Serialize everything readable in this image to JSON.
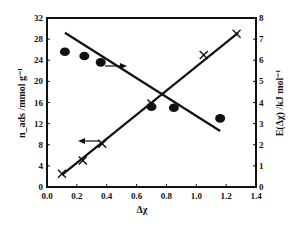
{
  "chart_data": {
    "type": "scatter",
    "title": "",
    "xlabel": "Δχ",
    "ylabel_left": "n_ads /mmol g⁻¹",
    "ylabel_right": "E(Δχ) /kJ mol⁻¹",
    "xlim": [
      0.0,
      1.4
    ],
    "ylim_left": [
      0,
      32
    ],
    "ylim_right": [
      0,
      8
    ],
    "x_ticks": [
      "0.0",
      "0.2",
      "0.4",
      "0.6",
      "0.8",
      "1.0",
      "1.2",
      "1.4"
    ],
    "y_ticks_left": [
      "0",
      "4",
      "8",
      "12",
      "16",
      "20",
      "24",
      "28",
      "32"
    ],
    "y_ticks_right": [
      "0",
      "1",
      "2",
      "3",
      "4",
      "5",
      "6",
      "7",
      "8"
    ],
    "grid": false,
    "legend": "none (arrows indicate axis for each series)",
    "series": [
      {
        "name": "n_ads",
        "axis": "left",
        "marker": "cross",
        "arrow": "left",
        "x": [
          0.1,
          0.24,
          0.37,
          0.7,
          1.05,
          1.27
        ],
        "values": [
          2.5,
          5.0,
          8.2,
          15.8,
          25.0,
          29.0
        ],
        "fit_line": {
          "x": [
            0.1,
            1.28
          ],
          "y": [
            2.3,
            29.2
          ]
        }
      },
      {
        "name": "E(Δχ)",
        "axis": "right",
        "marker": "filled-circle",
        "arrow": "right",
        "x": [
          0.12,
          0.25,
          0.36,
          0.7,
          0.85,
          1.16
        ],
        "values": [
          6.4,
          6.2,
          5.9,
          3.8,
          3.75,
          3.25
        ],
        "fit_line": {
          "x": [
            0.12,
            1.16
          ],
          "y": [
            7.3,
            2.65
          ]
        }
      }
    ]
  }
}
